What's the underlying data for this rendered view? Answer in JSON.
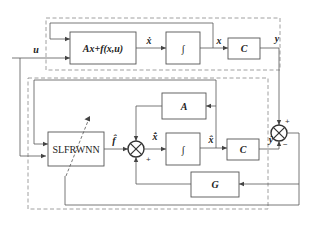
{
  "diagram": {
    "type": "block-diagram",
    "plant": {
      "dynamics_block": "Ax+f(x,u)",
      "integrator_block": "∫",
      "output_block": "C"
    },
    "observer": {
      "network_block": "SLFRWNN",
      "a_block": "A",
      "integrator_block": "∫",
      "output_block": "C",
      "gain_block": "G"
    },
    "signals": {
      "input": "u",
      "state_derivative": "ẋ",
      "state": "x",
      "output": "y",
      "f_hat": "f̂",
      "state_hat_derivative": "x̂̇",
      "state_hat": "x̂",
      "output_hat": "ŷ"
    },
    "signs": {
      "observer_sum_bottom": "+",
      "error_sum_top": "+",
      "error_sum_bottom": "−"
    }
  }
}
